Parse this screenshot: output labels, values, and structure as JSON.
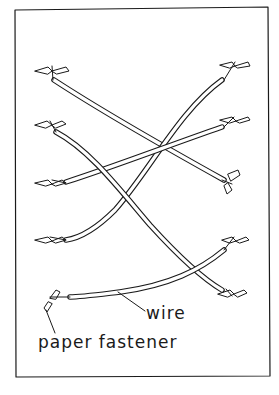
{
  "diagram": {
    "labels": {
      "wire": "wire",
      "paper_fastener": "paper fastener"
    },
    "colors": {
      "ink": "#1a1a1a",
      "background": "#ffffff"
    },
    "frame": {
      "x": 15,
      "y": 9,
      "width": 254,
      "height": 367
    },
    "wires": [
      {
        "id": "A",
        "from": [
          52,
          72
        ],
        "to": [
          228,
          184
        ]
      },
      {
        "id": "B",
        "from": [
          228,
          72
        ],
        "to": [
          62,
          240
        ]
      },
      {
        "id": "C",
        "from": [
          52,
          128
        ],
        "to": [
          226,
          292
        ]
      },
      {
        "id": "D",
        "from": [
          226,
          124
        ],
        "to": [
          62,
          183
        ]
      },
      {
        "id": "E",
        "from": [
          228,
          244
        ],
        "to": [
          60,
          297
        ]
      }
    ]
  }
}
